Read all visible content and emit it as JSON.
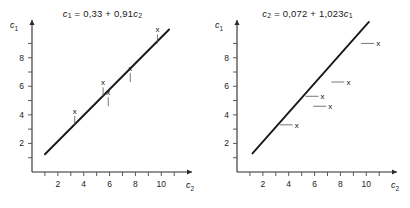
{
  "figure": {
    "background": "#ffffff",
    "line_color": "#1a1a1a",
    "axis_color": "#2b2b2b",
    "marker_glyph": "x"
  },
  "panels": [
    {
      "id": "left",
      "title": "c1 = 0,33 + 0,91 c2",
      "title_parts": {
        "lhs_var": "c",
        "lhs_sub": "1",
        "eq": "=",
        "intercept": "0,33",
        "plus": "+",
        "slope": "0,91",
        "rhs_var": "c",
        "rhs_sub": "2"
      },
      "leader_direction": "vertical",
      "chart_data": {
        "type": "scatter",
        "title": "c1 = 0,33 + 0,91 c2",
        "xlabel": "c2",
        "ylabel": "c1",
        "xlim": [
          0,
          11.6
        ],
        "ylim": [
          0,
          9.8
        ],
        "xticks": [
          1,
          2,
          3,
          4,
          5,
          6,
          7,
          8,
          9,
          10,
          11
        ],
        "yticks": [
          1,
          2,
          3,
          4,
          5,
          6,
          7,
          8,
          9
        ],
        "xticklabels": [
          "2",
          "4",
          "6",
          "8",
          "10"
        ],
        "xticklabel_values": [
          2,
          4,
          6,
          8,
          10
        ],
        "yticklabels": [
          "2",
          "4",
          "6",
          "8"
        ],
        "yticklabel_values": [
          2,
          4,
          6,
          8
        ],
        "grid": false,
        "legend": null,
        "fit": {
          "intercept": 0.33,
          "slope": 0.91,
          "x_start": 1.0,
          "x_end": 10.6
        },
        "points": [
          {
            "x": 3.3,
            "y": 3.3
          },
          {
            "x": 5.5,
            "y": 5.3
          },
          {
            "x": 5.9,
            "y": 4.6
          },
          {
            "x": 7.6,
            "y": 6.3
          },
          {
            "x": 9.7,
            "y": 9.0
          }
        ]
      }
    },
    {
      "id": "right",
      "title": "c2 = 0,072 + 1,023 c1",
      "title_parts": {
        "lhs_var": "c",
        "lhs_sub": "2",
        "eq": "=",
        "intercept": "0,072",
        "plus": "+",
        "slope": "1,023",
        "rhs_var": "c",
        "rhs_sub": "1"
      },
      "leader_direction": "horizontal",
      "chart_data": {
        "type": "scatter",
        "title": "c2 = 0,072 + 1,023 c1",
        "xlabel": "c2",
        "ylabel": "c1",
        "xlim": [
          0,
          11.6
        ],
        "ylim": [
          0,
          9.8
        ],
        "xticks": [
          1,
          2,
          3,
          4,
          5,
          6,
          7,
          8,
          9,
          10,
          11
        ],
        "yticks": [
          1,
          2,
          3,
          4,
          5,
          6,
          7,
          8,
          9
        ],
        "xticklabels": [
          "2",
          "4",
          "6",
          "8",
          "10"
        ],
        "xticklabel_values": [
          2,
          4,
          6,
          8,
          10
        ],
        "yticklabels": [
          "2",
          "4",
          "6",
          "8"
        ],
        "yticklabel_values": [
          2,
          4,
          6,
          8
        ],
        "grid": false,
        "legend": null,
        "fit": {
          "intercept": 0.072,
          "slope": 1.023,
          "x_start": 1.2,
          "x_end": 10.2
        },
        "points": [
          {
            "x": 3.3,
            "y": 3.3
          },
          {
            "x": 5.3,
            "y": 5.3
          },
          {
            "x": 5.9,
            "y": 4.6
          },
          {
            "x": 7.3,
            "y": 6.3
          },
          {
            "x": 9.6,
            "y": 9.0
          }
        ]
      }
    }
  ]
}
